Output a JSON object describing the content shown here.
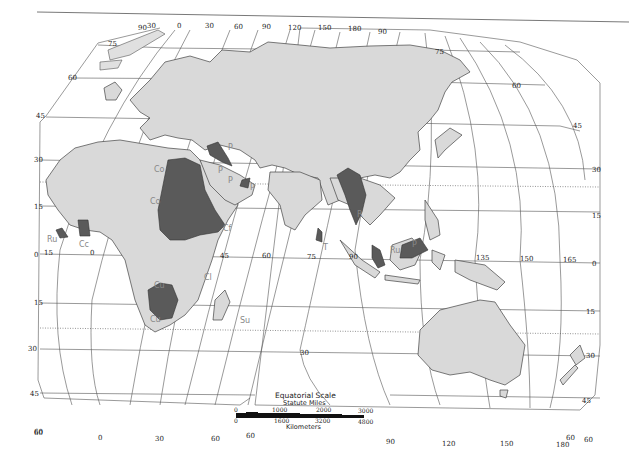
{
  "map": {
    "type": "World map (Eastern Hemisphere), equal-area projection",
    "colors": {
      "land": "#d9d9d9",
      "highlight_region": "#5a5a5a",
      "ocean": "#ffffff",
      "label": "#888888"
    },
    "latitude_labels_left": [
      "45",
      "30",
      "15",
      "0",
      "15",
      "30",
      "45",
      "60"
    ],
    "latitude_labels_right": [
      "75",
      "60",
      "45",
      "30",
      "15",
      "0",
      "15",
      "30",
      "45",
      "60"
    ],
    "longitude_labels_top": [
      "90",
      "30",
      "0",
      "30",
      "60",
      "90",
      "120",
      "150",
      "180",
      "90"
    ],
    "longitude_labels_equator": [
      "15",
      "0",
      "45",
      "60",
      "75",
      "90",
      "135",
      "150",
      "165"
    ],
    "longitude_labels_bottom": [
      "60",
      "0",
      "30",
      "60",
      "60",
      "90",
      "120",
      "150",
      "180",
      "60"
    ],
    "latitude_labels_inner": [
      "75",
      "60",
      "30"
    ],
    "region_labels": [
      {
        "code": "P",
        "area": "Mesopotamia"
      },
      {
        "code": "P",
        "area": "Arabia north"
      },
      {
        "code": "P",
        "area": "Persian Gulf"
      },
      {
        "code": "P",
        "area": "Oman"
      },
      {
        "code": "Co",
        "area": "Sahara north"
      },
      {
        "code": "Co",
        "area": "Sahara central"
      },
      {
        "code": "Ru",
        "area": "West Africa coast"
      },
      {
        "code": "Cc",
        "area": "Ghana"
      },
      {
        "code": "Cf",
        "area": "Horn of Africa"
      },
      {
        "code": "Cl",
        "area": "East Africa coast"
      },
      {
        "code": "Cu",
        "area": "Central Africa"
      },
      {
        "code": "Cu",
        "area": "Southern Africa"
      },
      {
        "code": "Su",
        "area": "Mascarene islands"
      },
      {
        "code": "T",
        "area": "Sri Lanka"
      },
      {
        "code": "R",
        "area": "Burma"
      },
      {
        "code": "Ru",
        "area": "Malay Peninsula"
      },
      {
        "code": "P",
        "area": "Borneo"
      }
    ],
    "scale": {
      "title": "Equatorial Scale",
      "miles_label": "Statute Miles",
      "miles_ticks": [
        "0",
        "1000",
        "2000",
        "3000"
      ],
      "km_ticks": [
        "0",
        "1600",
        "3200",
        "4800"
      ],
      "km_label": "Kilometers"
    }
  }
}
